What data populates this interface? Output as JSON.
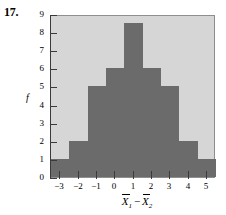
{
  "problem": {
    "number": "17."
  },
  "chart_data": {
    "type": "bar",
    "title": "",
    "xlabel": "Ẍ1 − Ẍ2",
    "ylabel": "f",
    "categories": [
      "-3",
      "-2",
      "-1",
      "0",
      "1",
      "2",
      "3",
      "4",
      "5"
    ],
    "values": [
      1,
      2,
      5,
      6,
      8.5,
      6,
      5,
      2,
      1
    ],
    "xlim": [
      -3.5,
      5.5
    ],
    "ylim": [
      0,
      9
    ],
    "ytick_labels": [
      "0",
      "1",
      "2",
      "3",
      "4",
      "5",
      "6",
      "7",
      "8",
      "9"
    ],
    "ytick_values": [
      0,
      1,
      2,
      3,
      4,
      5,
      6,
      7,
      8,
      9
    ],
    "xtick_labels": [
      "−3",
      "−2",
      "−1",
      "0",
      "1",
      "2",
      "3",
      "4",
      "5"
    ],
    "xtick_values": [
      -3,
      -2,
      -1,
      0,
      1,
      2,
      3,
      4,
      5
    ],
    "grid": false,
    "legend": "none",
    "bar_color": "#6b6b6b",
    "panel_color": "#d6d6d6",
    "axis_color": "#3a3a3a"
  },
  "axis_labels": {
    "x_symbol_1": "X",
    "x_sub_1": "1",
    "x_minus": "−",
    "x_symbol_2": "X",
    "x_sub_2": "2",
    "y_symbol": "f"
  }
}
